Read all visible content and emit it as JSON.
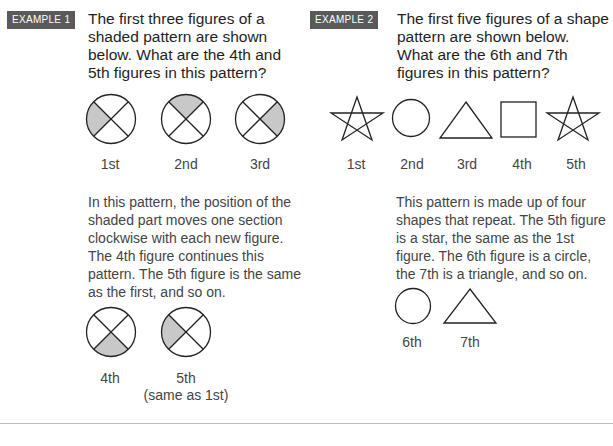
{
  "example1": {
    "badge": "EXAMPLE 1",
    "question": "The first three figures of a shaded pattern are shown below. What are the 4th and 5th figures in this pattern?",
    "figures": [
      {
        "label": "1st",
        "shaded": "left"
      },
      {
        "label": "2nd",
        "shaded": "top"
      },
      {
        "label": "3rd",
        "shaded": "right"
      }
    ],
    "explanation": "In this pattern, the position of the shaded part moves one section clockwise with each new figure. The 4th figure continues this pattern. The 5th figure is the same as the first, and so on.",
    "answers": [
      {
        "label": "4th",
        "sublabel": "",
        "shaded": "bottom"
      },
      {
        "label": "5th",
        "sublabel": "(same as 1st)",
        "shaded": "left"
      }
    ]
  },
  "example2": {
    "badge": "EXAMPLE 2",
    "question": "The first five figures of a shape pattern are shown below. What are the 6th and 7th figures in this pattern?",
    "figures": [
      {
        "label": "1st",
        "shape": "star"
      },
      {
        "label": "2nd",
        "shape": "circle"
      },
      {
        "label": "3rd",
        "shape": "triangle"
      },
      {
        "label": "4th",
        "shape": "square"
      },
      {
        "label": "5th",
        "shape": "star"
      }
    ],
    "explanation": "This pattern is made up of four shapes that repeat. The 5th figure is a star, the same as the 1st figure. The 6th figure is a circle, the 7th is a triangle, and so on.",
    "answers": [
      {
        "label": "6th",
        "shape": "circle"
      },
      {
        "label": "7th",
        "shape": "triangle"
      }
    ]
  },
  "colors": {
    "shade": "#c8c8c8",
    "stroke": "#222222",
    "badge": "#5a5a5a"
  }
}
